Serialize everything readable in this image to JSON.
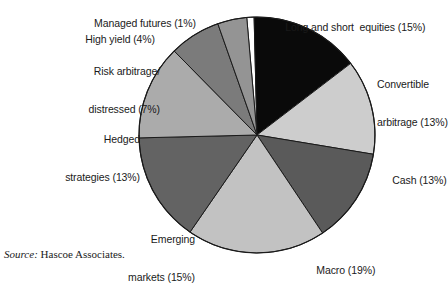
{
  "chart_data": {
    "type": "pie",
    "title": "",
    "subtitle": "",
    "xlabel": "",
    "ylabel": "",
    "legend_position": "labels-around-pie",
    "grid": false,
    "units": "percent",
    "start_angle_deg": -5,
    "direction": "clockwise",
    "categories": [
      "Managed futures",
      "Long and short  equities",
      "Convertible arbitrage",
      "Cash",
      "Macro",
      "Emerging markets",
      "Hedged strategies",
      "Risk arbitrage/ distressed",
      "High yield"
    ],
    "values": [
      1,
      15,
      13,
      13,
      19,
      15,
      13,
      7,
      4
    ],
    "slice_colors": [
      "#ffffff",
      "#0a0a0a",
      "#cdcdcd",
      "#5a5a5a",
      "#c2c2c2",
      "#636363",
      "#ababab",
      "#7b7b7b",
      "#949494"
    ],
    "slices": [
      {
        "label": "Managed futures (1%)",
        "name": "Managed futures",
        "value": 1,
        "color": "#ffffff"
      },
      {
        "label": "Long and short  equities (15%)",
        "name": "Long and short  equities",
        "value": 15,
        "color": "#0a0a0a"
      },
      {
        "label": "Convertible arbitrage (13%)",
        "name": "Convertible arbitrage",
        "value": 13,
        "color": "#cdcdcd"
      },
      {
        "label": "Cash (13%)",
        "name": "Cash",
        "value": 13,
        "color": "#5a5a5a"
      },
      {
        "label": "Macro (19%)",
        "name": "Macro",
        "value": 19,
        "color": "#c2c2c2"
      },
      {
        "label": "Emerging markets (15%)",
        "name": "Emerging markets",
        "value": 15,
        "color": "#636363"
      },
      {
        "label": "Hedged strategies (13%)",
        "name": "Hedged strategies",
        "value": 13,
        "color": "#ababab"
      },
      {
        "label": "Risk arbitrage/ distressed (7%)",
        "name": "Risk arbitrage/distressed",
        "value": 7,
        "color": "#7b7b7b"
      },
      {
        "label": "High yield (4%)",
        "name": "High yield",
        "value": 4,
        "color": "#949494"
      }
    ]
  },
  "labels": {
    "long_short": "Long and short  equities (15%)",
    "convertible_line1": "Convertible",
    "convertible_line2": "arbitrage (13%)",
    "cash": "Cash (13%)",
    "macro": "Macro (19%)",
    "emerging_line1": "Emerging",
    "emerging_line2": "markets (15%)",
    "hedged_line1": "Hedged",
    "hedged_line2": "strategies (13%)",
    "risk_line1": "Risk arbitrage/",
    "risk_line2": "distressed (7%)",
    "high_yield": "High yield (4%)",
    "managed_futures": "Managed futures (1%)"
  },
  "source": {
    "prefix": "Source:",
    "text": "Hascoe Associates."
  },
  "style": {
    "outline_color": "#1a1a1a",
    "text_color": "#1a1a1a",
    "background": "#ffffff"
  }
}
